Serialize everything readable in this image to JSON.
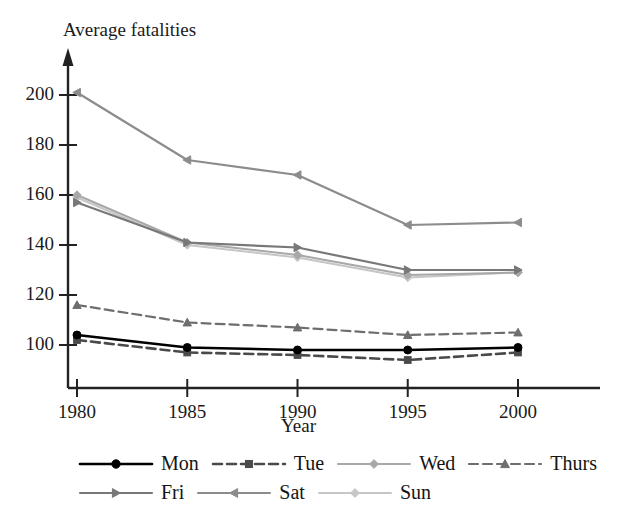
{
  "chart_data": {
    "type": "line",
    "title": "",
    "ylabel": "Average fatalities",
    "xlabel": "Year",
    "x": [
      1980,
      1985,
      1990,
      1995,
      2000
    ],
    "xtick_labels": [
      "1980",
      "1985",
      "1990",
      "1995",
      "2000"
    ],
    "ytick_labels": [
      "100",
      "120",
      "140",
      "160",
      "180",
      "200"
    ],
    "yticks": [
      100,
      120,
      140,
      160,
      180,
      200
    ],
    "ylim": [
      88,
      212
    ],
    "xlim": [
      1978.2,
      2002.0
    ],
    "grid": false,
    "legend_position": "bottom",
    "series": [
      {
        "name": "Mon",
        "values": [
          104,
          99,
          98,
          98,
          99
        ],
        "color": "#000000",
        "style": "solid",
        "marker": "circle",
        "width": 2.6
      },
      {
        "name": "Tue",
        "values": [
          102,
          97,
          96,
          94,
          97
        ],
        "color": "#4a4a4a",
        "style": "dashed",
        "marker": "square",
        "width": 2.6
      },
      {
        "name": "Wed",
        "values": [
          160,
          141,
          136,
          128,
          129
        ],
        "color": "#a8a8a8",
        "style": "solid",
        "marker": "diamond",
        "width": 2.0
      },
      {
        "name": "Thurs",
        "values": [
          116,
          109,
          107,
          104,
          105
        ],
        "color": "#6e6e6e",
        "style": "dashed",
        "marker": "triangle-up",
        "width": 2.2
      },
      {
        "name": "Fri",
        "values": [
          157,
          141,
          139,
          130,
          130
        ],
        "color": "#787878",
        "style": "solid",
        "marker": "triangle-right",
        "width": 2.2
      },
      {
        "name": "Sat",
        "values": [
          201,
          174,
          168,
          148,
          149
        ],
        "color": "#8c8c8c",
        "style": "solid",
        "marker": "triangle-left",
        "width": 2.2
      },
      {
        "name": "Sun",
        "values": [
          159,
          140,
          135,
          127,
          129
        ],
        "color": "#c6c6c6",
        "style": "solid",
        "marker": "diamond",
        "width": 2.0
      }
    ]
  },
  "axes": {
    "y_axis_title": "Average fatalities",
    "x_axis_title": "Year"
  },
  "legend": {
    "rows": [
      [
        "Mon",
        "Tue",
        "Wed",
        "Thurs"
      ],
      [
        "Fri",
        "Sat",
        "Sun"
      ]
    ]
  }
}
